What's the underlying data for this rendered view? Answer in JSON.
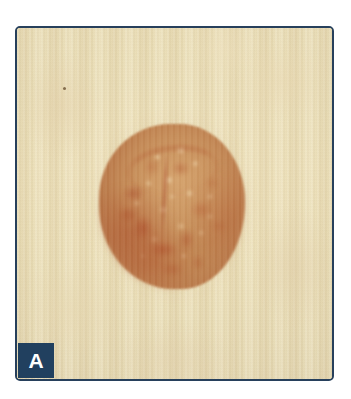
{
  "figure": {
    "panel_label": "A",
    "label_box_color": "#21405f",
    "label_text_color": "#ffffff",
    "frame_border_color": "#27405c",
    "skin_base_color": "#eadfb7",
    "lesion_center_color": "#c89a64",
    "lesion_edge_color": "#b0703f",
    "lesion_dark_pigment_color": "#a8462a",
    "lesion_highlight_color": "#eece9e",
    "background_color": "#ffffff"
  }
}
